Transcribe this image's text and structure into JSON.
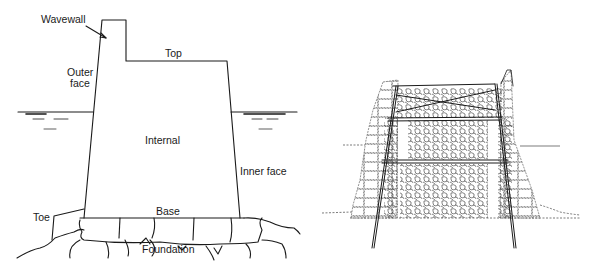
{
  "figure": {
    "left_diagram": {
      "description": "Cross-section of a dry-stone breakwater wall",
      "labels": {
        "wavewall": "Wavewall",
        "top": "Top",
        "outer_face_line1": "Outer",
        "outer_face_line2": "face",
        "internal": "Internal",
        "inner_face": "Inner face",
        "toe": "Toe",
        "base": "Base",
        "foundation": "Foundation"
      }
    },
    "right_diagram": {
      "description": "Stone masonry wall section with timber frame and rubble core"
    },
    "colors": {
      "line": "#1a1a1a",
      "background": "#ffffff"
    }
  }
}
